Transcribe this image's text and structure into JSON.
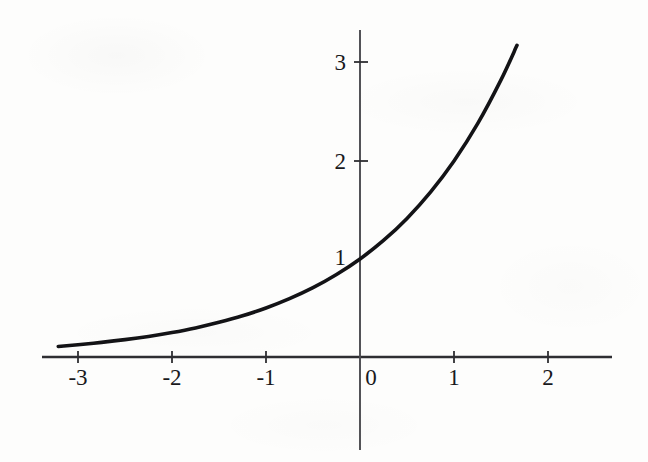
{
  "figure": {
    "background_color": "#fdfdfc",
    "ink_color": "#19191c",
    "curve_color": "#131316",
    "axis_color": "#3a3a3e",
    "title": "",
    "caption": ""
  },
  "chart_data": {
    "type": "line",
    "title": "",
    "subtitle": "",
    "xlabel": "",
    "ylabel": "",
    "function": "y = 2^x",
    "grid": false,
    "legend": null,
    "legend_position": "none",
    "xlim": [
      -3.35,
      2.7
    ],
    "ylim": [
      -0.95,
      3.4
    ],
    "x_ticks": [
      -3,
      -2,
      -1,
      0,
      1,
      2
    ],
    "x_tick_labels": [
      "-3",
      "-2",
      "-1",
      "0",
      "1",
      "2"
    ],
    "y_ticks": [
      1,
      2,
      3
    ],
    "y_tick_labels": [
      "1",
      "2",
      "3"
    ],
    "x_axis_range_drawn": [
      -3.38,
      2.68
    ],
    "y_axis_range_drawn": [
      -0.95,
      3.34
    ],
    "series": [
      {
        "name": "y = 2^x",
        "x": [
          -3.21,
          -3.0,
          -2.75,
          -2.5,
          -2.25,
          -2.0,
          -1.75,
          -1.5,
          -1.25,
          -1.0,
          -0.75,
          -0.5,
          -0.25,
          0.0,
          0.25,
          0.5,
          0.75,
          1.0,
          1.25,
          1.5,
          1.67
        ],
        "values": [
          0.108,
          0.125,
          0.149,
          0.177,
          0.21,
          0.25,
          0.297,
          0.354,
          0.42,
          0.5,
          0.595,
          0.707,
          0.841,
          1.0,
          1.189,
          1.414,
          1.682,
          2.0,
          2.378,
          2.828,
          3.18
        ]
      }
    ],
    "annotations": []
  }
}
